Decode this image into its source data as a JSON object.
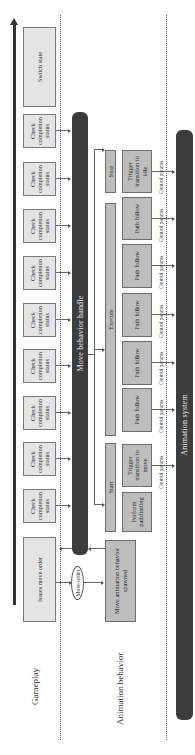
{
  "lanes": {
    "gameplay": "Gameplay",
    "animation_behavior": "Animation behavior"
  },
  "gameplay_row": {
    "issues_move_order": "Issues move order",
    "check_boxes": [
      "Check completion status",
      "Check completion status",
      "Check completion status",
      "Check completion status",
      "Check completion status",
      "Check completion status",
      "Check completion status",
      "Check completion status",
      "Check completion status"
    ],
    "switch_state": "Switch state"
  },
  "move_order_message": "Move order",
  "move_behavior_handle": "Move behavior handle",
  "spawned_box": "Move animation behavior spawned",
  "phases": {
    "start": "Start",
    "execute": "Execute",
    "stop": "Stop"
  },
  "actions": [
    "Perform pathfinding",
    "Trigger transition to move",
    "Path follow",
    "Path follow",
    "Path follow",
    "Path follow",
    "Path follow",
    "Trigger transition to idle"
  ],
  "control_params_label": "Control params",
  "animation_system": "Animation system",
  "colors": {
    "dark_bar": "#3d3d3d",
    "gameplay_box": "#e4e4e4",
    "behavior_box": "#bdbdbd"
  }
}
